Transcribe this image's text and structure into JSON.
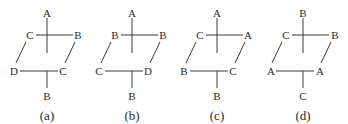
{
  "diagrams": [
    {
      "caption": "(a)",
      "top": "A",
      "upper_left": "C",
      "upper_right": "B",
      "lower_left": "D",
      "lower_right": "C",
      "bottom": "B"
    },
    {
      "caption": "(b)",
      "top": "A",
      "upper_left": "B",
      "upper_right": "B",
      "lower_left": "C",
      "lower_right": "D",
      "bottom": "B"
    },
    {
      "caption": "(c)",
      "top": "A",
      "upper_left": "C",
      "upper_right": "A",
      "lower_left": "B",
      "lower_right": "C",
      "bottom": "B"
    },
    {
      "caption": "(d)",
      "top": "B",
      "upper_left": "C",
      "upper_right": "B",
      "lower_left": "A",
      "lower_right": "A",
      "bottom": "C"
    }
  ]
}
